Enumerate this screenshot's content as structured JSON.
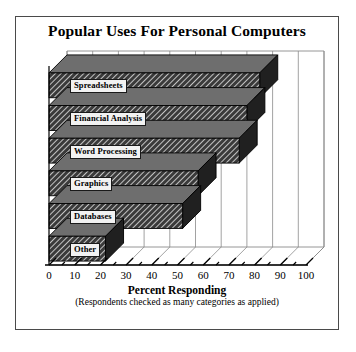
{
  "chart_data": {
    "type": "bar",
    "orientation": "horizontal",
    "style": "3d-hatched",
    "title": "Popular Uses For Personal Computers",
    "xlabel": "Percent Responding",
    "xlabel_note": "(Respondents checked as many categories as applied)",
    "ylabel": "",
    "categories": [
      "Spreadsheets",
      "Financial Analysis",
      "Word Processing",
      "Graphics",
      "Databases",
      "Other"
    ],
    "values": [
      82,
      77,
      74,
      58,
      52,
      22
    ],
    "xlim": [
      0,
      100
    ],
    "xticks": [
      0,
      10,
      20,
      30,
      40,
      50,
      60,
      70,
      80,
      90,
      100
    ],
    "xtick_labels": [
      "0",
      "10",
      "20",
      "30",
      "40",
      "50",
      "60",
      "70",
      "80",
      "90",
      "100"
    ],
    "grid": true,
    "legend": false,
    "colors": {
      "bar_fill": "#3a3a3a",
      "bar_hatch": "#ffffff",
      "bar_top": "#6e6e6e",
      "bar_side": "#202020",
      "frame": "#4a4a4a",
      "grid": "#8a8a8a",
      "axis": "#000000",
      "label_box": "#f2f2f2"
    }
  },
  "figure": {
    "frame_visible": true
  }
}
